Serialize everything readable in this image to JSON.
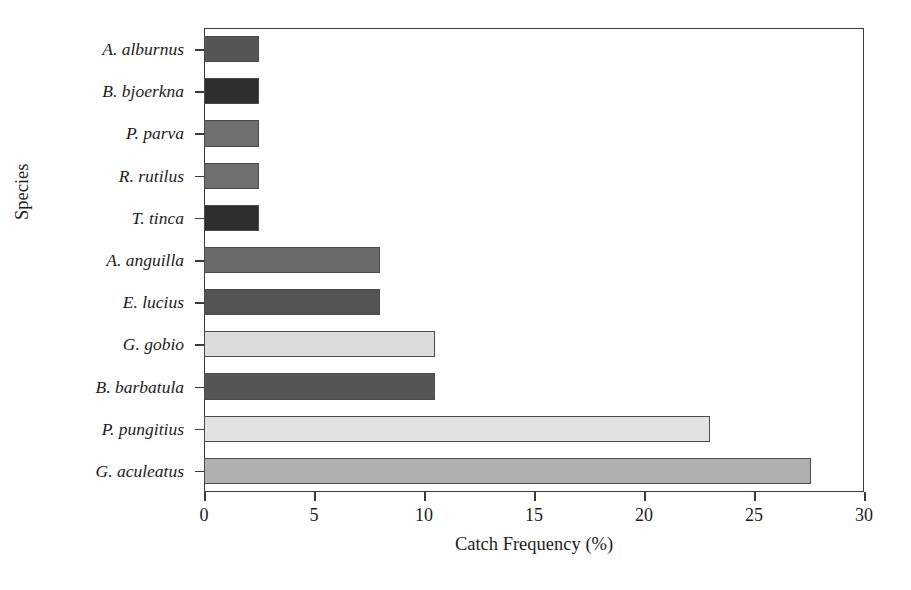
{
  "chart_data": {
    "type": "bar",
    "orientation": "horizontal",
    "title": "",
    "xlabel": "Catch Frequency (%)",
    "ylabel": "Species",
    "xlim": [
      0,
      30
    ],
    "xticks": [
      0,
      5,
      10,
      15,
      20,
      25,
      30
    ],
    "grid": false,
    "legend": false,
    "categories": [
      "A. alburnus",
      "B. bjoerkna",
      "P. parva",
      "R. rutilus",
      "T. tinca",
      "A. anguilla",
      "E. lucius",
      "G. gobio",
      "B. barbatula",
      "P. pungitius",
      "G. aculeatus"
    ],
    "values": [
      2.5,
      2.5,
      2.5,
      2.5,
      2.5,
      8.0,
      8.0,
      10.5,
      10.5,
      23.0,
      27.6
    ],
    "bar_colors": [
      "#565656",
      "#2e2e2e",
      "#6f6f6f",
      "#6f6f6f",
      "#2e2e2e",
      "#6b6b6b",
      "#545454",
      "#dcdcdc",
      "#565656",
      "#e2e2e2",
      "#b0b0b0"
    ],
    "bar_edge_color": "#4a4a4a",
    "axis_color": "#3a3a3a",
    "background_color": "#ffffff"
  }
}
